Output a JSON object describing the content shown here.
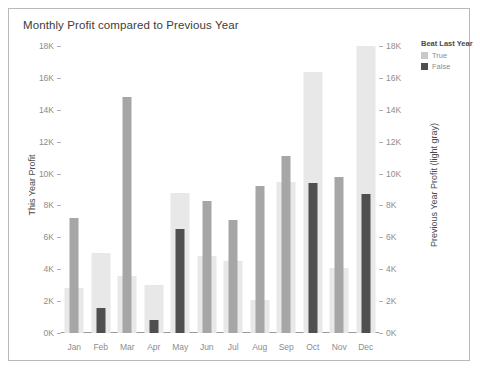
{
  "title": "Monthly Profit compared to Previous Year",
  "legend": {
    "title": "Beat Last Year",
    "items": [
      {
        "label": "True",
        "color": "#c9c9c9"
      },
      {
        "label": "False",
        "color": "#4f4f4f"
      }
    ]
  },
  "axes": {
    "left_title": "This Year Profit",
    "right_title": "Previous Year Profit (light gray)",
    "ticks": [
      "18K",
      "16K",
      "14K",
      "12K",
      "10K",
      "8K",
      "6K",
      "4K",
      "2K",
      "0K"
    ]
  },
  "chart_data": {
    "type": "bar",
    "title": "Monthly Profit compared to Previous Year",
    "xlabel": "",
    "ylabel": "This Year Profit",
    "y2label": "Previous Year Profit (light gray)",
    "ylim": [
      0,
      18000
    ],
    "y2lim": [
      0,
      18000
    ],
    "ytick_labels": [
      "0K",
      "2K",
      "4K",
      "6K",
      "8K",
      "10K",
      "12K",
      "14K",
      "16K",
      "18K"
    ],
    "grid": false,
    "legend_position": "right",
    "categories": [
      "Jan",
      "Feb",
      "Mar",
      "Apr",
      "May",
      "Jun",
      "Jul",
      "Aug",
      "Sep",
      "Oct",
      "Nov",
      "Dec"
    ],
    "series": [
      {
        "name": "Previous Year Profit",
        "axis": "right",
        "color": "#e8e8e8",
        "values": [
          2800,
          5000,
          3600,
          3000,
          8800,
          4800,
          4500,
          2100,
          9500,
          16400,
          4100,
          18000
        ]
      },
      {
        "name": "This Year Profit",
        "axis": "left",
        "values": [
          7200,
          1600,
          14800,
          800,
          6500,
          8300,
          7100,
          9200,
          11100,
          9400,
          9800,
          8700
        ],
        "beat_last_year": [
          true,
          false,
          true,
          false,
          false,
          true,
          true,
          true,
          true,
          false,
          true,
          false
        ],
        "colors": [
          "#a6a6a6",
          "#4f4f4f",
          "#a6a6a6",
          "#4f4f4f",
          "#4f4f4f",
          "#a6a6a6",
          "#a6a6a6",
          "#a6a6a6",
          "#a6a6a6",
          "#4f4f4f",
          "#a6a6a6",
          "#4f4f4f"
        ]
      }
    ]
  }
}
